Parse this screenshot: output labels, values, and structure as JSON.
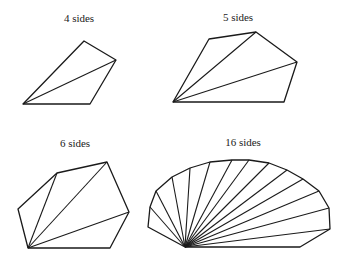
{
  "figures": [
    {
      "label": "4 sides",
      "label_pos": [
        79,
        12
      ],
      "vertices": [
        [
          23,
          104
        ],
        [
          84,
          41
        ],
        [
          116,
          60
        ],
        [
          90,
          104
        ]
      ]
    },
    {
      "label": "5 sides",
      "label_pos": [
        238,
        11
      ],
      "vertices": [
        [
          173,
          102
        ],
        [
          209,
          39
        ],
        [
          256,
          32
        ],
        [
          297,
          62
        ],
        [
          284,
          102
        ]
      ]
    },
    {
      "label": "6 sides",
      "label_pos": [
        75,
        137
      ],
      "vertices": [
        [
          28,
          248
        ],
        [
          18,
          209
        ],
        [
          57,
          173
        ],
        [
          107,
          162
        ],
        [
          129,
          212
        ],
        [
          110,
          248
        ]
      ]
    },
    {
      "label": "16 sides",
      "label_pos": [
        243,
        136
      ],
      "vertices": [
        [
          185,
          247
        ],
        [
          148,
          227
        ],
        [
          150,
          207
        ],
        [
          156,
          191
        ],
        [
          172,
          177
        ],
        [
          190,
          168
        ],
        [
          210,
          162
        ],
        [
          232,
          160
        ],
        [
          249,
          160
        ],
        [
          269,
          163
        ],
        [
          287,
          170
        ],
        [
          303,
          179
        ],
        [
          319,
          191
        ],
        [
          329,
          208
        ],
        [
          330,
          229
        ],
        [
          300,
          247
        ]
      ]
    }
  ]
}
